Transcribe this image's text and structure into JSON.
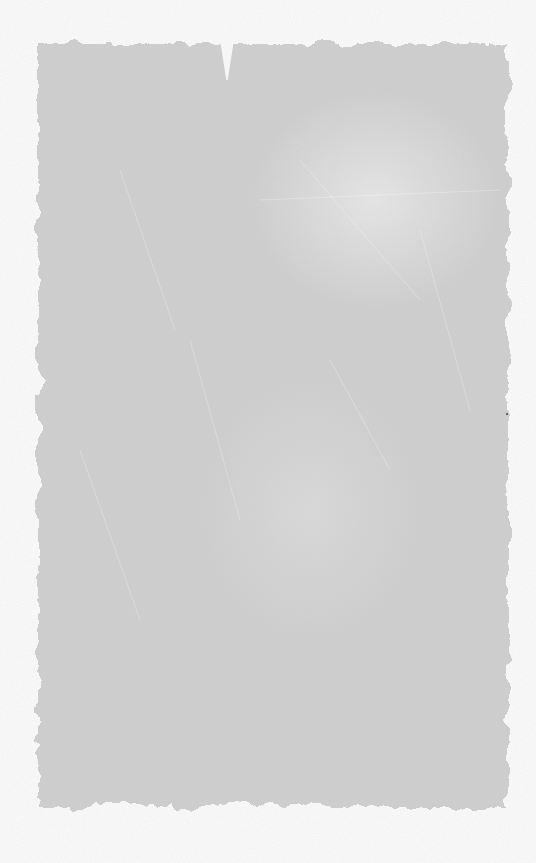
{
  "texture": {
    "description": "Grunge paint-brushed paper texture",
    "background_color": "#fcfcfc",
    "paint_color": "#cfcfcf",
    "highlight_color": "#ebebeb"
  }
}
